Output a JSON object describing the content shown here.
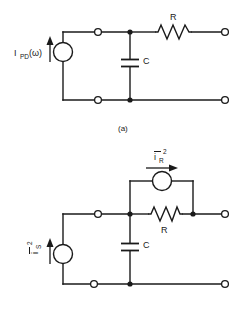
{
  "figure": {
    "background_color": "#ffffff",
    "line_color": "#1a1a1a"
  },
  "circuit_a": {
    "caption": "(a)",
    "source": {
      "name": "photodiode-current-source",
      "label_main": "I",
      "label_sub": "PD",
      "label_arg": "(ω)",
      "arrow_direction": "up"
    },
    "components": [
      {
        "type": "capacitor",
        "label": "C"
      },
      {
        "type": "resistor",
        "label": "R"
      }
    ],
    "terminals": [
      {
        "name": "top-left-terminal",
        "style": "open"
      },
      {
        "name": "bottom-left-terminal",
        "style": "open"
      },
      {
        "name": "top-right-terminal",
        "style": "open"
      },
      {
        "name": "bottom-right-terminal",
        "style": "open"
      }
    ],
    "junctions": [
      {
        "name": "top-node",
        "style": "solid"
      },
      {
        "name": "bottom-node",
        "style": "solid"
      }
    ]
  },
  "circuit_b": {
    "caption": "",
    "source_signal": {
      "name": "signal-noise-current-source",
      "label_main": "i",
      "label_sub": "S",
      "label_sup": "2",
      "overbar": true,
      "arrow_direction": "up",
      "orientation": "rotated"
    },
    "source_resistor_noise": {
      "name": "resistor-noise-current-source",
      "label_main": "i",
      "label_sub": "R",
      "label_sup": "2",
      "overbar": true,
      "arrow_direction": "right"
    },
    "components": [
      {
        "type": "capacitor",
        "label": "C"
      },
      {
        "type": "resistor",
        "label": "R"
      }
    ],
    "terminals": [
      {
        "name": "top-left-terminal",
        "style": "open"
      },
      {
        "name": "bottom-left-terminal",
        "style": "open"
      },
      {
        "name": "top-right-terminal",
        "style": "open"
      },
      {
        "name": "bottom-right-terminal",
        "style": "open"
      }
    ],
    "junctions": [
      {
        "name": "top-center-node",
        "style": "solid"
      },
      {
        "name": "bottom-center-node",
        "style": "solid"
      },
      {
        "name": "top-right-node",
        "style": "solid"
      }
    ]
  }
}
